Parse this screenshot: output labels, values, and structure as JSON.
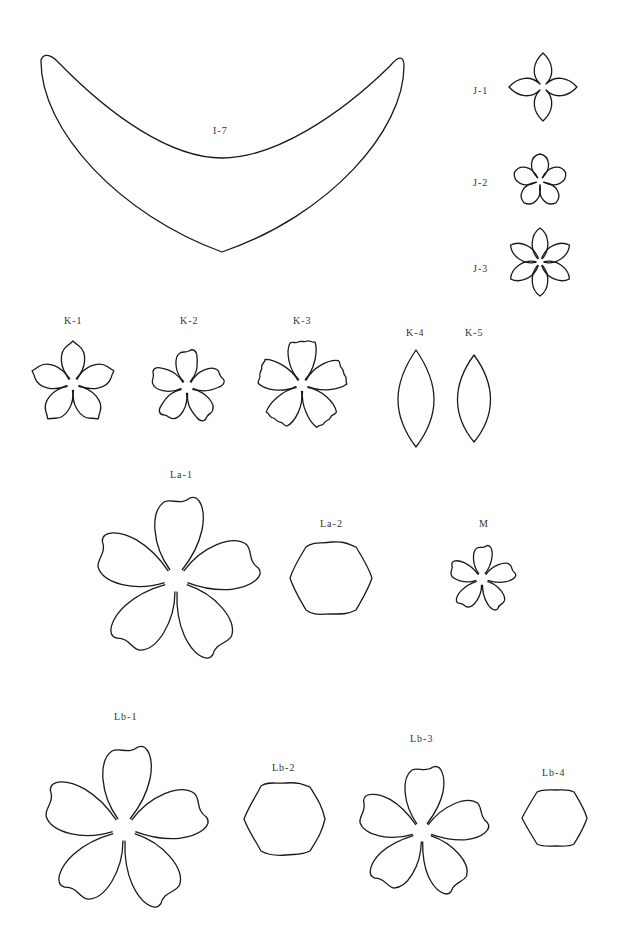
{
  "page": {
    "background": "#ffffff",
    "stroke_color": "#1a1a1a",
    "label_color": "#333333"
  },
  "templates": {
    "i7": {
      "label": "I-7",
      "shape": "crescent"
    },
    "j1": {
      "label": "J-1",
      "shape": "4-petal flower"
    },
    "j2": {
      "label": "J-2",
      "shape": "5-petal flower"
    },
    "j3": {
      "label": "J-3",
      "shape": "6-petal flower"
    },
    "k1": {
      "label": "K-1",
      "shape": "5-petal flower, notched tips"
    },
    "k2": {
      "label": "K-2",
      "shape": "5-petal flower, wavy tips"
    },
    "k3": {
      "label": "K-3",
      "shape": "5-petal flower, ruffled edges"
    },
    "k4": {
      "label": "K-4",
      "shape": "leaf (large)"
    },
    "k5": {
      "label": "K-5",
      "shape": "leaf (small)"
    },
    "la1": {
      "label": "La-1",
      "shape": "5-petal flower, large"
    },
    "la2": {
      "label": "La-2",
      "shape": "wavy hexagon"
    },
    "m": {
      "label": "M",
      "shape": "5-petal flower, small"
    },
    "lb1": {
      "label": "Lb-1",
      "shape": "5-petal flower, large"
    },
    "lb2": {
      "label": "Lb-2",
      "shape": "wavy hexagon"
    },
    "lb3": {
      "label": "Lb-3",
      "shape": "5-petal flower, medium"
    },
    "lb4": {
      "label": "Lb-4",
      "shape": "wavy hexagon, small"
    }
  }
}
